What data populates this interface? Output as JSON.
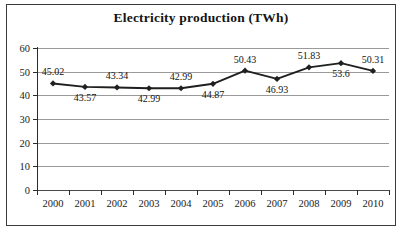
{
  "chart_data": {
    "type": "line",
    "title": "Electricity production (TWh)",
    "xlabel": "",
    "ylabel": "",
    "categories": [
      "2000",
      "2001",
      "2002",
      "2003",
      "2004",
      "2005",
      "2006",
      "2007",
      "2008",
      "2009",
      "2010"
    ],
    "values": [
      45.02,
      43.57,
      43.34,
      42.99,
      42.99,
      44.87,
      50.43,
      46.93,
      51.83,
      53.6,
      50.31
    ],
    "point_labels": [
      "45.02",
      "43.57",
      "43.34",
      "42.99",
      "42.99",
      "44.87",
      "50.43",
      "46.93",
      "51.83",
      "53.6",
      "50.31"
    ],
    "label_positions": [
      "above",
      "below",
      "above",
      "below",
      "above",
      "below",
      "above",
      "below",
      "above",
      "below",
      "above"
    ],
    "ylim": [
      0,
      60
    ],
    "yticks": [
      0,
      10,
      20,
      30,
      40,
      50,
      60
    ],
    "ytick_labels": [
      "0",
      "10",
      "20",
      "30",
      "40",
      "50",
      "60"
    ],
    "grid": true,
    "legend": false,
    "marker": "diamond",
    "series_color": "#1f1f1f",
    "grid_color": "#9a9a9a",
    "frame_color": "#3a3a3a"
  }
}
